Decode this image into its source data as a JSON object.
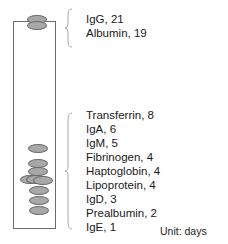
{
  "diagram": {
    "unit_label": "Unit: days",
    "groups": [
      {
        "name": "top-group",
        "items": [
          {
            "name": "IgG",
            "value": 21,
            "label": "IgG, 21"
          },
          {
            "name": "Albumin",
            "value": 19,
            "label": "Albumin, 19"
          }
        ]
      },
      {
        "name": "bottom-group",
        "items": [
          {
            "name": "Transferrin",
            "value": 8,
            "label": "Transferrin, 8"
          },
          {
            "name": "IgA",
            "value": 6,
            "label": "IgA, 6"
          },
          {
            "name": "IgM",
            "value": 5,
            "label": "IgM, 5"
          },
          {
            "name": "Fibrinogen",
            "value": 4,
            "label": "Fibrinogen, 4"
          },
          {
            "name": "Haptoglobin",
            "value": 4,
            "label": "Haptoglobin, 4"
          },
          {
            "name": "Lipoprotein",
            "value": 4,
            "label": "Lipoprotein, 4"
          },
          {
            "name": "IgD",
            "value": 3,
            "label": "IgD, 3"
          },
          {
            "name": "Prealbumin",
            "value": 2,
            "label": "Prealbumin, 2"
          },
          {
            "name": "IgE",
            "value": 1,
            "label": "IgE, 1"
          }
        ]
      }
    ],
    "colors": {
      "ellipse_fill": "#a8a8a8",
      "ellipse_stroke": "#6c6c6c",
      "tube_stroke": "#6a6a6a",
      "brace": "#aaaaaa"
    }
  }
}
